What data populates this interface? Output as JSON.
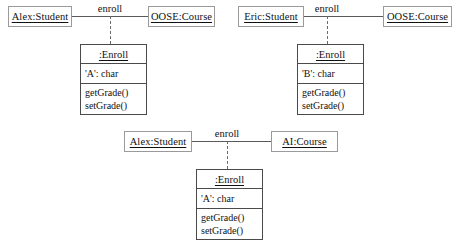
{
  "diagram": {
    "type": "uml-object-diagram",
    "background": "#ffffff",
    "line_color": "#5a5a5a",
    "box_border_color": "#4a4a4a",
    "object_border_color": "#9a9a9a"
  },
  "groups": [
    {
      "id": "group-top-left",
      "student": "Alex:Student",
      "course": "OOSE:Course",
      "link_label": "enroll",
      "assoc_class": {
        "title": ":Enroll",
        "attributes": [
          "'A':  char"
        ],
        "operations": [
          "getGrade()",
          "setGrade()"
        ]
      }
    },
    {
      "id": "group-top-right",
      "student": "Eric:Student",
      "course": "OOSE:Course",
      "link_label": "enroll",
      "assoc_class": {
        "title": ":Enroll",
        "attributes": [
          "'B':  char"
        ],
        "operations": [
          "getGrade()",
          "setGrade()"
        ]
      }
    },
    {
      "id": "group-bottom",
      "student": "Alex:Student",
      "course": "AI:Course",
      "link_label": "enroll",
      "assoc_class": {
        "title": ":Enroll",
        "attributes": [
          "'A':  char"
        ],
        "operations": [
          "getGrade()",
          "setGrade()"
        ]
      }
    }
  ]
}
